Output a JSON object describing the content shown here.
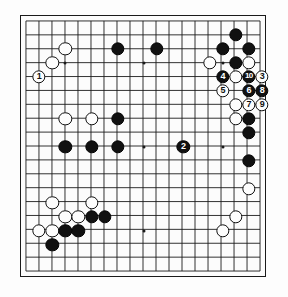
{
  "diagram": {
    "board_size": 19,
    "board_color": "#fcfcfc",
    "line_color": "#1a1a1a",
    "black_color": "#111111",
    "white_color": "#fdfdfd",
    "hoshi_points": [
      {
        "col": 3,
        "row": 3
      },
      {
        "col": 9,
        "row": 3
      },
      {
        "col": 15,
        "row": 3
      },
      {
        "col": 3,
        "row": 9
      },
      {
        "col": 9,
        "row": 9
      },
      {
        "col": 15,
        "row": 9
      },
      {
        "col": 3,
        "row": 15
      },
      {
        "col": 9,
        "row": 15
      },
      {
        "col": 15,
        "row": 15
      }
    ],
    "stones": [
      {
        "col": 17,
        "row": 2,
        "color": "black",
        "label": ""
      },
      {
        "col": 16,
        "row": 3,
        "color": "black",
        "label": ""
      },
      {
        "col": 18,
        "row": 3,
        "color": "black",
        "label": ""
      },
      {
        "col": 11,
        "row": 3,
        "color": "black",
        "label": ""
      },
      {
        "col": 8,
        "row": 3,
        "color": "black",
        "label": ""
      },
      {
        "col": 17,
        "row": 4,
        "color": "black",
        "label": ""
      },
      {
        "col": 18,
        "row": 4,
        "color": "white",
        "label": ""
      },
      {
        "col": 15,
        "row": 4,
        "color": "white",
        "label": ""
      },
      {
        "col": 4,
        "row": 3,
        "color": "white",
        "label": ""
      },
      {
        "col": 3,
        "row": 4,
        "color": "white",
        "label": ""
      },
      {
        "col": 2,
        "row": 5,
        "color": "white",
        "label": "1"
      },
      {
        "col": 16,
        "row": 5,
        "color": "black",
        "label": "4"
      },
      {
        "col": 17,
        "row": 5,
        "color": "white",
        "label": ""
      },
      {
        "col": 18,
        "row": 5,
        "color": "black",
        "label": "10"
      },
      {
        "col": 19,
        "row": 5,
        "color": "white",
        "label": "3"
      },
      {
        "col": 16,
        "row": 6,
        "color": "white",
        "label": "5"
      },
      {
        "col": 18,
        "row": 6,
        "color": "black",
        "label": "6"
      },
      {
        "col": 19,
        "row": 6,
        "color": "black",
        "label": "8"
      },
      {
        "col": 17,
        "row": 7,
        "color": "white",
        "label": ""
      },
      {
        "col": 18,
        "row": 7,
        "color": "white",
        "label": "7"
      },
      {
        "col": 19,
        "row": 7,
        "color": "white",
        "label": "9"
      },
      {
        "col": 17,
        "row": 8,
        "color": "white",
        "label": ""
      },
      {
        "col": 18,
        "row": 8,
        "color": "black",
        "label": ""
      },
      {
        "col": 18,
        "row": 9,
        "color": "black",
        "label": ""
      },
      {
        "col": 18,
        "row": 11,
        "color": "black",
        "label": ""
      },
      {
        "col": 13,
        "row": 10,
        "color": "black",
        "label": "2"
      },
      {
        "col": 4,
        "row": 8,
        "color": "white",
        "label": ""
      },
      {
        "col": 6,
        "row": 8,
        "color": "white",
        "label": ""
      },
      {
        "col": 8,
        "row": 8,
        "color": "black",
        "label": ""
      },
      {
        "col": 4,
        "row": 10,
        "color": "black",
        "label": ""
      },
      {
        "col": 6,
        "row": 10,
        "color": "black",
        "label": ""
      },
      {
        "col": 8,
        "row": 10,
        "color": "black",
        "label": ""
      },
      {
        "col": 18,
        "row": 13,
        "color": "white",
        "label": ""
      },
      {
        "col": 17,
        "row": 15,
        "color": "white",
        "label": ""
      },
      {
        "col": 16,
        "row": 16,
        "color": "white",
        "label": ""
      },
      {
        "col": 3,
        "row": 14,
        "color": "white",
        "label": ""
      },
      {
        "col": 6,
        "row": 14,
        "color": "white",
        "label": ""
      },
      {
        "col": 4,
        "row": 15,
        "color": "white",
        "label": ""
      },
      {
        "col": 5,
        "row": 15,
        "color": "white",
        "label": ""
      },
      {
        "col": 6,
        "row": 15,
        "color": "black",
        "label": ""
      },
      {
        "col": 7,
        "row": 15,
        "color": "black",
        "label": ""
      },
      {
        "col": 2,
        "row": 16,
        "color": "white",
        "label": ""
      },
      {
        "col": 3,
        "row": 16,
        "color": "white",
        "label": ""
      },
      {
        "col": 4,
        "row": 16,
        "color": "black",
        "label": ""
      },
      {
        "col": 5,
        "row": 16,
        "color": "black",
        "label": ""
      },
      {
        "col": 3,
        "row": 17,
        "color": "black",
        "label": ""
      }
    ]
  }
}
